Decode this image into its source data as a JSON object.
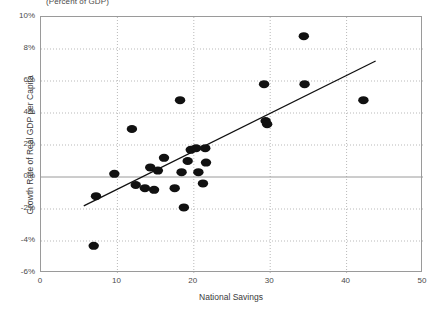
{
  "chart_data": {
    "type": "scatter",
    "title": "(Percent of GDP)",
    "xlabel": "National Savings",
    "ylabel": "Growth Rate of Real GDP per Capita",
    "xlim": [
      0,
      50
    ],
    "ylim": [
      -6,
      10
    ],
    "xticks": [
      0,
      10,
      20,
      30,
      40,
      50
    ],
    "xtick_labels": [
      "0",
      "10",
      "20",
      "30",
      "40",
      "50"
    ],
    "yticks": [
      -6,
      -4,
      -2,
      0,
      2,
      4,
      6,
      8,
      10
    ],
    "ytick_labels": [
      "-6%",
      "-4%",
      "-2%",
      "0%",
      "2%",
      "4%",
      "6%",
      "8%",
      "10%"
    ],
    "grid": "dotted-both",
    "legend": "none",
    "marker": {
      "shape": "ellipse",
      "color": "#111111",
      "size_px": 9
    },
    "zero_line": {
      "y": 0,
      "color": "#9a9a9a"
    },
    "trendline": {
      "type": "linear",
      "color": "#111111",
      "x_start": 5.6,
      "y_start": -1.8,
      "x_end": 43.8,
      "y_end": 7.25
    },
    "points": [
      {
        "x": 6.9,
        "y": -4.3
      },
      {
        "x": 7.2,
        "y": -1.2
      },
      {
        "x": 9.6,
        "y": 0.2
      },
      {
        "x": 11.9,
        "y": 3.0
      },
      {
        "x": 12.4,
        "y": -0.5
      },
      {
        "x": 13.6,
        "y": -0.7
      },
      {
        "x": 14.3,
        "y": 0.6
      },
      {
        "x": 14.8,
        "y": -0.8
      },
      {
        "x": 15.3,
        "y": 0.4
      },
      {
        "x": 16.1,
        "y": 1.2
      },
      {
        "x": 17.5,
        "y": -0.7
      },
      {
        "x": 18.2,
        "y": 4.8
      },
      {
        "x": 18.4,
        "y": 0.3
      },
      {
        "x": 18.7,
        "y": -1.9
      },
      {
        "x": 19.2,
        "y": 1.0
      },
      {
        "x": 19.6,
        "y": 1.7
      },
      {
        "x": 20.3,
        "y": 1.8
      },
      {
        "x": 20.6,
        "y": 0.3
      },
      {
        "x": 21.2,
        "y": -0.4
      },
      {
        "x": 21.5,
        "y": 1.8
      },
      {
        "x": 21.6,
        "y": 0.9
      },
      {
        "x": 29.2,
        "y": 5.8
      },
      {
        "x": 29.4,
        "y": 3.5
      },
      {
        "x": 29.6,
        "y": 3.3
      },
      {
        "x": 34.4,
        "y": 8.8
      },
      {
        "x": 34.5,
        "y": 5.8
      },
      {
        "x": 42.2,
        "y": 4.8
      }
    ]
  }
}
